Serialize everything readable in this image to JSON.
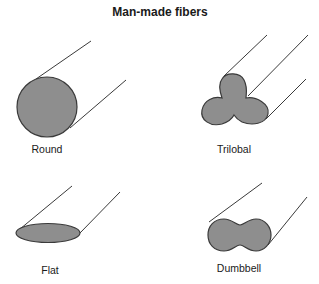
{
  "title": "Man-made fibers",
  "colors": {
    "fill": "#8e8e8e",
    "stroke": "#3a3a3a",
    "text": "#1a1a1a",
    "background": "#ffffff"
  },
  "fibers": [
    {
      "id": "round",
      "label": "Round"
    },
    {
      "id": "trilobal",
      "label": "Trilobal"
    },
    {
      "id": "flat",
      "label": "Flat"
    },
    {
      "id": "dumbbell",
      "label": "Dumbbell"
    }
  ]
}
